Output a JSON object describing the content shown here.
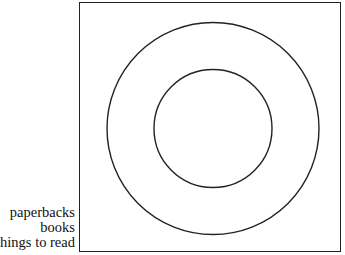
{
  "diagram": {
    "type": "euler-nested-circles",
    "labels": [
      {
        "text": "paperbacks",
        "refers_to": "inner circle"
      },
      {
        "text": "books",
        "refers_to": "outer circle"
      },
      {
        "text": "things to read",
        "refers_to": "enclosing rectangle"
      }
    ],
    "shapes": {
      "rectangle": {
        "x": 79,
        "y": 2,
        "width": 262,
        "height": 250
      },
      "outer_circle": {
        "cx": 213,
        "cy": 128,
        "r": 106
      },
      "inner_circle": {
        "cx": 213,
        "cy": 128,
        "r": 59
      }
    },
    "stroke_color": "#222222"
  }
}
